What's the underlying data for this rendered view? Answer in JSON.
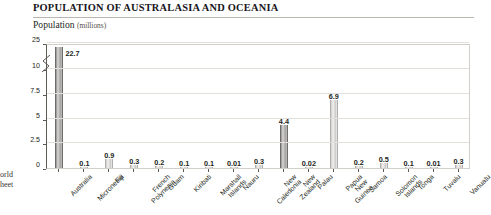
{
  "header": {
    "title": "POPULATION OF AUSTRALASIA AND OCEANIA"
  },
  "axis_title": {
    "text": "Population",
    "unit": "(millions)"
  },
  "corner_note": {
    "line1": "orld",
    "line2": "heet"
  },
  "chart_data": {
    "type": "bar",
    "title": "POPULATION OF AUSTRALASIA AND OCEANIA",
    "xlabel": "",
    "ylabel": "Population (millions)",
    "ylim": [
      0,
      25
    ],
    "grid": true,
    "legend": "none",
    "broken_axis": true,
    "break_between": [
      10,
      25
    ],
    "ytick_labels": [
      "0",
      "2.5",
      "5",
      "7.5",
      "10",
      "25"
    ],
    "ytick_values": [
      0,
      2.5,
      5,
      7.5,
      10,
      25
    ],
    "categories": [
      "Australia",
      "Micronesia",
      "Fiji",
      "French\nPolynesia",
      "Guam",
      "Kiribati",
      "Marshall\nIslands",
      "Nauru",
      "New\nCaledonia",
      "New\nZealand",
      "Palau",
      "Papua\nNew\nGuinea",
      "Samoa",
      "Solomon\nIslands",
      "Tonga",
      "Tuvalu",
      "Vanuatu"
    ],
    "values": [
      22.7,
      0.1,
      0.9,
      0.3,
      0.2,
      0.1,
      0.1,
      0.01,
      0.3,
      4.4,
      0.02,
      6.9,
      0.2,
      0.5,
      0.1,
      0.01,
      0.3
    ],
    "value_labels": [
      "22.7",
      "0.1",
      "0.9",
      "0.3",
      "0.2",
      "0.1",
      "0.1",
      "0.01",
      "0.3",
      "4.4",
      "0.02",
      "6.9",
      "0.2",
      "0.5",
      "0.1",
      "0.01",
      "0.3"
    ],
    "bar_styles": [
      "dark",
      "light",
      "light",
      "light",
      "light",
      "light",
      "light",
      "light",
      "light",
      "dark",
      "light",
      "light",
      "light",
      "light",
      "light",
      "light",
      "light"
    ],
    "colors": {
      "bar_dark": "#a3a1a0",
      "bar_light": "#dedcda",
      "grid": "#e3e0dc",
      "axis": "#5c5854",
      "text": "#231f20",
      "rule": "#b9b6b2"
    }
  }
}
